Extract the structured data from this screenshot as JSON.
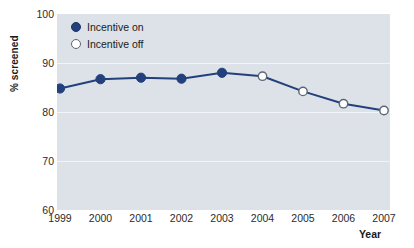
{
  "chart_data": {
    "type": "line",
    "title": "",
    "subtitle": "",
    "xlabel": "Year",
    "ylabel": "% screened",
    "categories": [
      "1999",
      "2000",
      "2001",
      "2002",
      "2003",
      "2004",
      "2005",
      "2006",
      "2007"
    ],
    "x": [
      1999,
      2000,
      2001,
      2002,
      2003,
      2004,
      2005,
      2006,
      2007
    ],
    "values": [
      84.8,
      86.7,
      87.0,
      86.8,
      88.0,
      87.3,
      84.2,
      81.7,
      80.3
    ],
    "marker_states": [
      "on",
      "on",
      "on",
      "on",
      "on",
      "off",
      "off",
      "off",
      "off"
    ],
    "series": [
      {
        "name": "% screened",
        "values": [
          84.8,
          86.7,
          87.0,
          86.8,
          88.0,
          87.3,
          84.2,
          81.7,
          80.3
        ]
      }
    ],
    "ylim": [
      60,
      100
    ],
    "yticks": [
      100,
      90,
      80,
      70,
      60
    ],
    "ytick_labels": [
      "100",
      "90",
      "80",
      "70",
      "60"
    ],
    "xlim": [
      1999,
      2007
    ],
    "grid": "horizontal",
    "legend_position": "top-left-inside",
    "legend": [
      {
        "key": "on",
        "label": "Incentive on",
        "marker": "filled-circle"
      },
      {
        "key": "off",
        "label": "Incentive off",
        "marker": "hollow-circle"
      }
    ],
    "colors": {
      "line": "#22407c",
      "marker_filled": "#22407c",
      "marker_hollow_fill": "#ffffff",
      "marker_hollow_edge": "#5f6673",
      "plot_background": "#dde2e8",
      "gridline": "#f2f4f7",
      "figure_background": "#ffffff",
      "text": "#1a1a1a"
    }
  }
}
